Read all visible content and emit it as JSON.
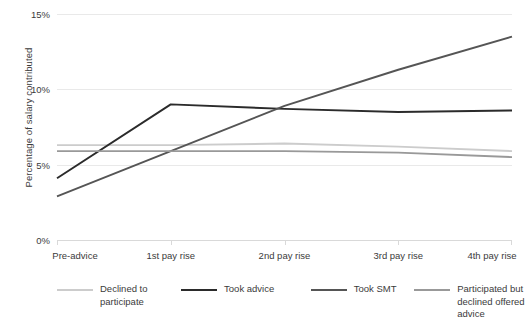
{
  "chart_data": {
    "type": "line",
    "title": "",
    "xlabel": "",
    "ylabel": "Percentage of salary contributed",
    "categories": [
      "Pre-advice",
      "1st pay rise",
      "2nd pay rise",
      "3rd pay rise",
      "4th pay rise"
    ],
    "ylim": [
      0,
      15
    ],
    "yticks": [
      0,
      5,
      10,
      15
    ],
    "ytick_labels": [
      "0%",
      "5%",
      "10%",
      "15%"
    ],
    "grid": true,
    "legend_position": "bottom",
    "series": [
      {
        "name": "Declined to participate",
        "color": "#cccccc",
        "values": [
          6.3,
          6.3,
          6.4,
          6.2,
          5.9
        ]
      },
      {
        "name": "Took advice",
        "color": "#2b2b2b",
        "values": [
          4.1,
          9.0,
          8.7,
          8.5,
          8.6
        ]
      },
      {
        "name": "Took SMT",
        "color": "#555555",
        "values": [
          2.9,
          5.9,
          8.9,
          11.3,
          13.5
        ]
      },
      {
        "name": "Participated but declined offered advice",
        "color": "#999999",
        "values": [
          5.9,
          5.9,
          5.9,
          5.8,
          5.5
        ]
      }
    ]
  },
  "legend": {
    "items": [
      {
        "label": "Declined to participate"
      },
      {
        "label": "Took advice"
      },
      {
        "label": "Took SMT"
      },
      {
        "label": "Participated but declined offered advice"
      }
    ]
  }
}
